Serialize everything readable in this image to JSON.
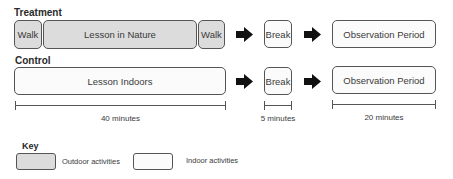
{
  "colors": {
    "outdoor_fill": "#dcdcdc",
    "indoor_fill": "#fbfbfb",
    "border": "#555555",
    "arrow": "#111111"
  },
  "treatment": {
    "label": "Treatment",
    "activities": [
      {
        "label": "Walk",
        "type": "outdoor"
      },
      {
        "label": "Lesson in Nature",
        "type": "outdoor"
      },
      {
        "label": "Walk",
        "type": "outdoor"
      }
    ],
    "break_label": "Break",
    "observation_label": "Observation Period"
  },
  "control": {
    "label": "Control",
    "activities": [
      {
        "label": "Lesson Indoors",
        "type": "indoor"
      }
    ],
    "break_label": "Break",
    "observation_label": "Observation Period"
  },
  "timeline": [
    {
      "label": "40 minutes"
    },
    {
      "label": "5 minutes"
    },
    {
      "label": "20 minutes"
    }
  ],
  "key": {
    "title": "Key",
    "items": [
      {
        "label": "Outdoor activities",
        "type": "outdoor"
      },
      {
        "label": "Indoor activities",
        "type": "indoor"
      }
    ]
  }
}
